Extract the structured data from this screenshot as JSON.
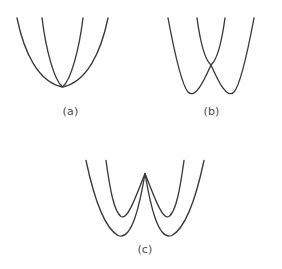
{
  "figure": {
    "kind": "potential-energy-curve-diagram",
    "background_color": "#ffffff",
    "stroke_color": "#3a3a3a",
    "stroke_width": 1.35,
    "label_color": "#4a4a4a",
    "panel_count": 3
  },
  "panels": [
    {
      "id": "a",
      "label": "(a)",
      "description": "Two nested parabolas sharing a common minimum",
      "curves": [
        {
          "name": "wide-parabola",
          "shape": "parabola",
          "path": "M 17 18 C 24 52, 38 82, 62.5 87 C 87 82, 101 52, 108 18"
        },
        {
          "name": "narrow-parabola",
          "shape": "parabola",
          "path": "M 42 18 C 46 50, 54 80, 62.5 87 C 71 80, 79 50, 83 18"
        }
      ]
    },
    {
      "id": "b",
      "label": "(b)",
      "description": "Double-well curve crossed by a narrow parabola whose minimum meets the central barrier peak",
      "curves": [
        {
          "name": "double-well-curve",
          "shape": "double-well",
          "path": "M 27 18 C 33 50, 40 84, 47 92 C 54 99, 62 83, 70 65 C 78 83, 86 99, 93 92 C 100 84, 107 50, 113 18"
        },
        {
          "name": "narrow-parabola",
          "shape": "parabola",
          "path": "M 56 18 C 59 40, 64 60, 70 65 C 76 60, 81 40, 84 18"
        }
      ]
    },
    {
      "id": "c",
      "label": "(c)",
      "description": "Two nested double-well curves with coincident central barrier peaks",
      "curves": [
        {
          "name": "outer-double-well",
          "shape": "double-well",
          "path": "M 26 15 C 33 48, 44 82, 58 90 C 72 96, 80 58, 85 28 C 90 58, 98 96, 112 90 C 126 82, 137 48, 144 15"
        },
        {
          "name": "inner-double-well",
          "shape": "double-well",
          "path": "M 46 15 C 50 44, 54 66, 61 71 C 68 75, 77 48, 85 28 C 93 48, 102 75, 109 71 C 116 66, 120 44, 124 15"
        }
      ]
    }
  ]
}
